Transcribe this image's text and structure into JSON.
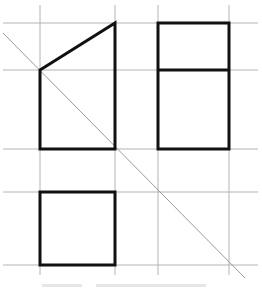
{
  "diagram": {
    "type": "three-view orthographic projection drawing",
    "colors": {
      "grid": "#b0b0b0",
      "diagonal": "#9a9a9a",
      "outline": "#111111",
      "background": "#ffffff"
    },
    "grid": {
      "vertical_x": [
        40,
        115,
        158,
        229
      ],
      "horizontal_y": [
        23,
        70,
        149,
        192,
        265
      ]
    },
    "views": [
      {
        "name": "front-view",
        "shape": "trapezoid",
        "points": [
          [
            40,
            70
          ],
          [
            115,
            23
          ],
          [
            115,
            149
          ],
          [
            40,
            149
          ]
        ]
      },
      {
        "name": "side-view",
        "shape": "rectangle split horizontally",
        "rect": [
          158,
          23,
          229,
          149
        ],
        "divider_y": 70
      },
      {
        "name": "top-view",
        "shape": "square",
        "rect": [
          40,
          192,
          115,
          265
        ]
      }
    ],
    "diagonal": {
      "from": [
        3,
        33
      ],
      "to": [
        245,
        278
      ]
    }
  }
}
